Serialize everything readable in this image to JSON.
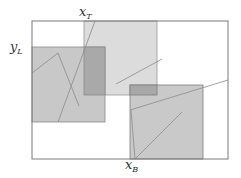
{
  "diagram": {
    "labels": {
      "x_top": {
        "base": "x",
        "sub": "T"
      },
      "y_left": {
        "base": "y",
        "sub": "L"
      },
      "x_bottom": {
        "base": "x",
        "sub": "B"
      }
    },
    "colors": {
      "frame_stroke": "#7a7a7a",
      "left_fill": "#c8c8c8",
      "top_fill": "#dcdcdc",
      "bottom_fill": "#c9c9c9",
      "overlap_fill": "#a8a8a8",
      "rect_stroke": "#8a8a8a",
      "line_stroke": "#8f8f8f"
    },
    "frame": {
      "x": 32,
      "y": 21,
      "w": 196,
      "h": 138
    },
    "rects": [
      {
        "name": "top-square",
        "x": 84,
        "y": 21,
        "w": 73,
        "h": 74
      },
      {
        "name": "left-square",
        "x": 32,
        "y": 47,
        "w": 73,
        "h": 75
      },
      {
        "name": "bottom-square",
        "x": 130,
        "y": 85,
        "w": 73,
        "h": 74
      }
    ],
    "overlaps": [
      {
        "name": "left-top-overlap",
        "x": 84,
        "y": 47,
        "w": 21,
        "h": 48
      },
      {
        "name": "top-bottom-overlap",
        "x": 130,
        "y": 85,
        "w": 27,
        "h": 10
      }
    ]
  }
}
